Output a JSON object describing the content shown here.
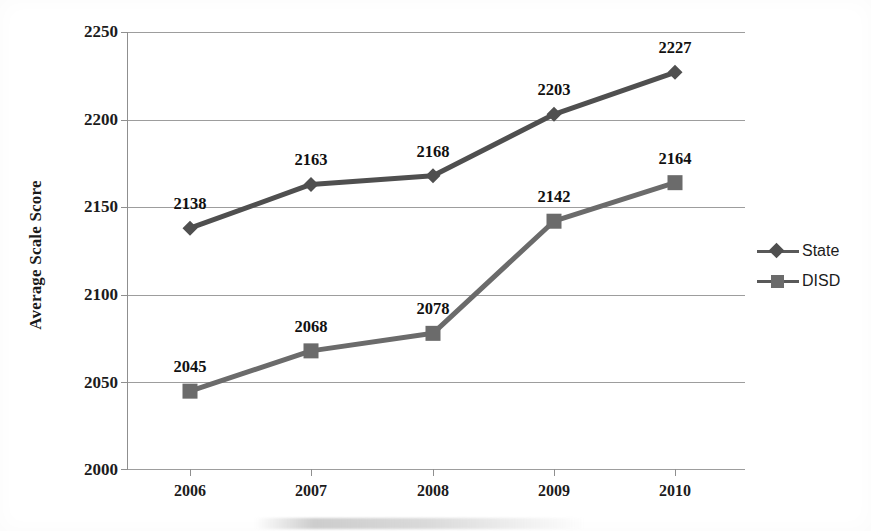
{
  "chart_data": {
    "type": "line",
    "title": "",
    "xlabel": "",
    "ylabel": "Average Scale Score",
    "categories": [
      "2006",
      "2007",
      "2008",
      "2009",
      "2010"
    ],
    "ylim": [
      2000,
      2250
    ],
    "yticks": [
      "2000",
      "2050",
      "2100",
      "2150",
      "2200",
      "2250"
    ],
    "grid": true,
    "legend_position": "right",
    "series": [
      {
        "name": "State",
        "marker": "diamond",
        "color": "#4f4f4f",
        "values": [
          2138,
          2163,
          2168,
          2203,
          2227
        ],
        "labels": [
          "2138",
          "2163",
          "2168",
          "2203",
          "2227"
        ]
      },
      {
        "name": "DISD",
        "marker": "square",
        "color": "#6b6b6b",
        "values": [
          2045,
          2068,
          2078,
          2142,
          2164
        ],
        "labels": [
          "2045",
          "2068",
          "2078",
          "2142",
          "2164"
        ]
      }
    ]
  },
  "legend": {
    "items": [
      {
        "label": "State",
        "marker": "diamond-marker-icon"
      },
      {
        "label": "DISD",
        "marker": "square-marker-icon"
      }
    ]
  },
  "axes": {
    "y_title": "Average Scale Score",
    "y_ticks": [
      "2250",
      "2200",
      "2150",
      "2100",
      "2050",
      "2000"
    ],
    "x_ticks": [
      "2006",
      "2007",
      "2008",
      "2009",
      "2010"
    ]
  },
  "colors": {
    "state_line": "#4f4f4f",
    "disd_line": "#6b6b6b",
    "gridline": "#9d9d9d",
    "axis": "#8f8f8f",
    "text": "#1c1c1c",
    "background": "#ffffff"
  }
}
